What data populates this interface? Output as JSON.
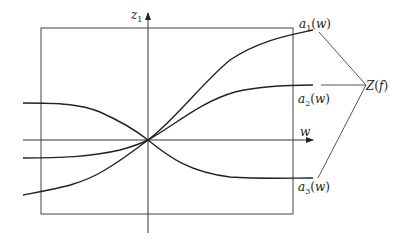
{
  "diagram": {
    "axes": {
      "vertical_label": "z",
      "vertical_label_sub": "1",
      "horizontal_label": "w"
    },
    "curves": [
      {
        "id": "a1",
        "name": "a",
        "sub": "1",
        "arg": "w"
      },
      {
        "id": "a2",
        "name": "a",
        "sub": "2",
        "arg": "w"
      },
      {
        "id": "a3",
        "name": "a",
        "sub": "3",
        "arg": "w"
      }
    ],
    "group_label": "Z(f)",
    "group_label_parts": {
      "name": "Z",
      "arg": "f"
    }
  }
}
